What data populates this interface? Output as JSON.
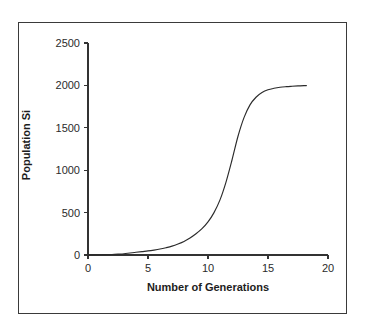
{
  "figure": {
    "background_color": "#ffffff",
    "frame_color": "#3a3a3a",
    "axis_color": "#333333",
    "curve_color": "#2b2b2b"
  },
  "chart_data": {
    "type": "line",
    "title": "",
    "subtitle": "",
    "xlabel": "Number of Generations",
    "ylabel": "Population Si",
    "xlim": [
      0,
      20
    ],
    "ylim": [
      0,
      2500
    ],
    "xticks": [
      0,
      5,
      10,
      15,
      20
    ],
    "yticks": [
      0,
      500,
      1000,
      1500,
      2000,
      2500
    ],
    "xtick_labels": [
      "0",
      "5",
      "10",
      "15",
      "20"
    ],
    "ytick_labels": [
      "0",
      "500",
      "1000",
      "1500",
      "2000",
      "2500"
    ],
    "grid": false,
    "legend": null,
    "legend_position": "none",
    "annotations": [],
    "series": [
      {
        "name": "Population Si",
        "color": "#2b2b2b",
        "line_width": 1,
        "marker": "none",
        "model": "logistic",
        "model_params": {
          "carrying_capacity": 2000,
          "growth_rate": 0.95,
          "inflection_generation": 12.3
        },
        "x": [
          0,
          0.5,
          1,
          1.5,
          2,
          2.5,
          3,
          3.5,
          4,
          4.5,
          5,
          5.5,
          6,
          6.5,
          7,
          7.5,
          8,
          8.5,
          9,
          9.5,
          10,
          10.5,
          11,
          11.5,
          12,
          12.5,
          13,
          13.5,
          14,
          14.5,
          15,
          15.5,
          16,
          16.5,
          17,
          17.5,
          18,
          18.2
        ],
        "y": [
          1,
          2,
          3,
          4,
          6,
          10,
          15,
          24,
          32,
          40,
          48,
          58,
          70,
          86,
          105,
          130,
          160,
          200,
          250,
          310,
          390,
          500,
          650,
          860,
          1120,
          1400,
          1620,
          1770,
          1860,
          1915,
          1948,
          1966,
          1978,
          1985,
          1990,
          1994,
          1997,
          1998
        ]
      }
    ]
  },
  "geometry": {
    "plot_origin_px": {
      "x": 88,
      "y": 255
    },
    "plot_x_max_px": 328,
    "plot_y_max_px": 43
  }
}
